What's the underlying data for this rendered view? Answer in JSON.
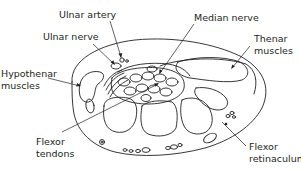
{
  "diagram": {
    "type": "anatomical cross-section",
    "line_color": "#231f20",
    "background": "#ffffff",
    "labels": {
      "ulnar_artery": "Ulnar artery",
      "ulnar_nerve": "Ulnar nerve",
      "median_nerve": "Median nerve",
      "thenar_muscles_line1": "Thenar",
      "thenar_muscles_line2": "muscles",
      "hypothenar_muscles_line1": "Hypothenar",
      "hypothenar_muscles_line2": "muscles",
      "flexor_tendons_line1": "Flexor",
      "flexor_tendons_line2": "tendons",
      "flexor_retinaculum_line1": "Flexor",
      "flexor_retinaculum_line2": "retinaculum"
    }
  }
}
